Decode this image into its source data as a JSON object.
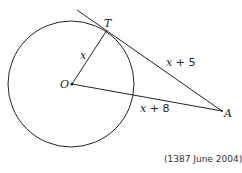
{
  "diagram": {
    "type": "circle-tangent-geometry",
    "points": {
      "O": {
        "label": "O",
        "x": 72,
        "y": 84
      },
      "T": {
        "label": "T",
        "x": 107,
        "y": 30
      },
      "A": {
        "label": "A",
        "x": 222,
        "y": 111
      }
    },
    "circle": {
      "cx": 71,
      "cy": 84,
      "r": 63
    },
    "tangent_line": {
      "x1": 77,
      "y1": 10,
      "x2": 222,
      "y2": 111
    },
    "segment_labels": {
      "OT": {
        "var": "x"
      },
      "TA": {
        "var": "x",
        "rest": " + 5"
      },
      "OA": {
        "var": "x",
        "rest": " + 8"
      }
    },
    "citation": "(1387 June 2004)",
    "stroke_color": "#222222"
  }
}
